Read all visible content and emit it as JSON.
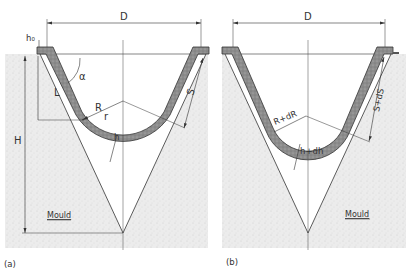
{
  "figure": {
    "panels": [
      {
        "id": "a",
        "caption": "(a)",
        "labels": {
          "diameter": "D",
          "flange_thickness": "h₀",
          "height": "H",
          "length": "L",
          "angle": "α",
          "radius_R": "R",
          "radius_r": "r",
          "thickness": "h",
          "slant": "S",
          "mould": "Mould"
        }
      },
      {
        "id": "b",
        "caption": "(b)",
        "labels": {
          "diameter": "D",
          "radius": "R+dR",
          "thickness": "h+dh",
          "slant": "S+dS",
          "mould": "Mould"
        }
      }
    ],
    "colors": {
      "line": "#333333",
      "sheet_fill": "#8a8a8a",
      "mould_fill": "#e9e9e9",
      "background": "#ffffff"
    }
  }
}
